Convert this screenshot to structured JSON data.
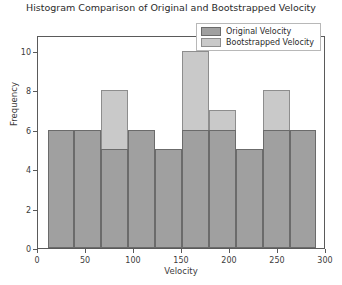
{
  "chart_data": {
    "type": "bar",
    "title": "Histogram Comparison of Original and Bootstrapped Velocity",
    "xlabel": "Velocity",
    "ylabel": "Frequency",
    "xlim": [
      0,
      300
    ],
    "ylim": [
      0,
      10.8
    ],
    "xticks": [
      0,
      50,
      100,
      150,
      200,
      250,
      300
    ],
    "yticks": [
      0,
      2,
      4,
      6,
      8,
      10
    ],
    "grid": false,
    "legend_position": "top-right",
    "bin_edges": [
      10,
      38,
      66,
      94,
      122,
      150,
      178,
      206,
      234,
      262,
      290
    ],
    "bin_centers": [
      24,
      52,
      80,
      108,
      136,
      164,
      192,
      220,
      248,
      276
    ],
    "series": [
      {
        "name": "Original Velocity",
        "color": "#a0a0a0",
        "edge_color": "#6b6b6b",
        "values": [
          6,
          6,
          5,
          6,
          5,
          6,
          6,
          5,
          6,
          6
        ]
      },
      {
        "name": "Bootstrapped Velocity",
        "color": "#c9c9c9",
        "edge_color": "#8d8d8d",
        "values": [
          4,
          4,
          8,
          4,
          3,
          10,
          7,
          3,
          8,
          4
        ]
      }
    ]
  },
  "legend": {
    "items": [
      {
        "label": "Original Velocity"
      },
      {
        "label": "Bootstrapped Velocity"
      }
    ]
  }
}
